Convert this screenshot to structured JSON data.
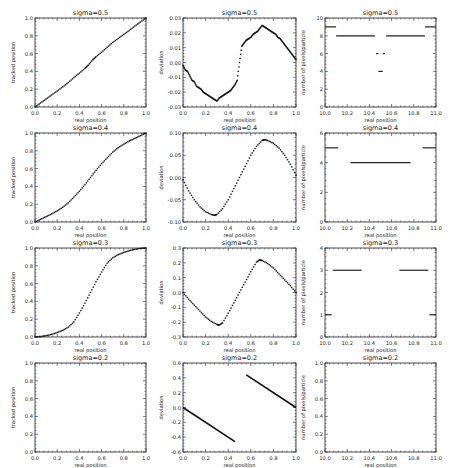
{
  "figure": {
    "rows": 4,
    "cols": 3,
    "layout": {
      "col_x": [
        [
          35,
          146
        ],
        [
          183,
          296
        ],
        [
          325,
          436
        ]
      ],
      "row_y": [
        [
          18,
          107
        ],
        [
          133,
          222
        ],
        [
          248,
          337
        ],
        [
          363,
          452
        ]
      ]
    }
  },
  "chart_data": [
    {
      "id": "r1c1",
      "type": "line",
      "title": "sigma=0.5",
      "xlabel": "real position",
      "ylabel": "tracked position",
      "xlim": [
        0.0,
        1.0
      ],
      "ylim": [
        0.0,
        1.0
      ],
      "xticks": [
        "0.0",
        "0.2",
        "0.4",
        "0.6",
        "0.8",
        "1.0"
      ],
      "yticks": [
        "0.0",
        "0.2",
        "0.4",
        "0.6",
        "0.8",
        "1.0"
      ],
      "series": [
        {
          "name": "tracked",
          "style": "dots",
          "x": [
            0.0,
            0.05,
            0.1,
            0.15,
            0.2,
            0.25,
            0.3,
            0.35,
            0.4,
            0.45,
            0.48,
            0.52,
            0.55,
            0.6,
            0.65,
            0.7,
            0.75,
            0.8,
            0.85,
            0.9,
            0.95,
            1.0
          ],
          "y": [
            0.0,
            0.045,
            0.09,
            0.135,
            0.18,
            0.226,
            0.275,
            0.33,
            0.38,
            0.435,
            0.47,
            0.53,
            0.565,
            0.615,
            0.67,
            0.725,
            0.77,
            0.815,
            0.86,
            0.91,
            0.955,
            1.0
          ]
        }
      ]
    },
    {
      "id": "r1c2",
      "type": "scatter",
      "title": "sigma=0.5",
      "xlabel": "real position",
      "ylabel": "deviation",
      "xlim": [
        0.0,
        1.0
      ],
      "ylim": [
        -0.03,
        0.03
      ],
      "xticks": [
        "0.0",
        "0.2",
        "0.4",
        "0.6",
        "0.8",
        "1.0"
      ],
      "yticks": [
        "-0.03",
        "-0.02",
        "-0.01",
        "0.00",
        "0.01",
        "0.02",
        "0.03"
      ],
      "series": [
        {
          "name": "deviation",
          "style": "dots",
          "x": [
            0.0,
            0.02,
            0.04,
            0.06,
            0.08,
            0.1,
            0.12,
            0.14,
            0.16,
            0.18,
            0.2,
            0.22,
            0.24,
            0.26,
            0.28,
            0.3,
            0.32,
            0.34,
            0.36,
            0.38,
            0.4,
            0.42,
            0.44,
            0.46,
            0.48,
            0.5,
            0.52,
            0.54,
            0.56,
            0.58,
            0.6,
            0.62,
            0.64,
            0.66,
            0.68,
            0.7,
            0.72,
            0.74,
            0.76,
            0.78,
            0.8,
            0.82,
            0.84,
            0.86,
            0.88,
            0.9,
            0.92,
            0.94,
            0.96,
            0.98,
            1.0
          ],
          "y": [
            -0.002,
            -0.005,
            -0.006,
            -0.009,
            -0.012,
            -0.013,
            -0.016,
            -0.017,
            -0.018,
            -0.02,
            -0.021,
            -0.022,
            -0.023,
            -0.024,
            -0.025,
            -0.026,
            -0.024,
            -0.023,
            -0.022,
            -0.021,
            -0.02,
            -0.019,
            -0.017,
            -0.015,
            -0.012,
            0.0,
            0.011,
            0.013,
            0.015,
            0.016,
            0.017,
            0.019,
            0.02,
            0.021,
            0.023,
            0.025,
            0.024,
            0.023,
            0.022,
            0.021,
            0.02,
            0.019,
            0.017,
            0.016,
            0.014,
            0.012,
            0.01,
            0.008,
            0.006,
            0.004,
            0.002
          ]
        }
      ]
    },
    {
      "id": "r1c3",
      "type": "scatter",
      "title": "sigma=0.5",
      "xlabel": "real position",
      "ylabel": "number of pixels/particle",
      "xlim": [
        10.0,
        11.0
      ],
      "ylim": [
        0,
        10
      ],
      "xticks": [
        "10.0",
        "10.2",
        "10.4",
        "10.6",
        "10.8",
        "11.0"
      ],
      "yticks": [
        "0",
        "2",
        "4",
        "6",
        "8",
        "10"
      ],
      "segments": [
        {
          "x0": 10.0,
          "x1": 10.1,
          "y": 9
        },
        {
          "x0": 10.1,
          "x1": 10.45,
          "y": 8
        },
        {
          "x0": 10.55,
          "x1": 10.9,
          "y": 8
        },
        {
          "x0": 10.9,
          "x1": 11.0,
          "y": 9
        },
        {
          "x0": 10.46,
          "x1": 10.48,
          "y": 6
        },
        {
          "x0": 10.52,
          "x1": 10.54,
          "y": 6
        },
        {
          "x0": 10.48,
          "x1": 10.52,
          "y": 4
        }
      ]
    },
    {
      "id": "r2c1",
      "type": "line",
      "title": "sigma=0.4",
      "xlabel": "real position",
      "ylabel": "tracked position",
      "xlim": [
        0.0,
        1.0
      ],
      "ylim": [
        0.0,
        1.0
      ],
      "xticks": [
        "0.0",
        "0.2",
        "0.4",
        "0.6",
        "0.8",
        "1.0"
      ],
      "yticks": [
        "0.0",
        "0.2",
        "0.4",
        "0.6",
        "0.8",
        "1.0"
      ],
      "series": [
        {
          "name": "tracked",
          "style": "dots",
          "x": [
            0.0,
            0.05,
            0.1,
            0.15,
            0.2,
            0.25,
            0.3,
            0.35,
            0.4,
            0.45,
            0.5,
            0.55,
            0.6,
            0.65,
            0.7,
            0.75,
            0.8,
            0.85,
            0.9,
            0.95,
            1.0
          ],
          "y": [
            0.0,
            0.03,
            0.06,
            0.09,
            0.125,
            0.165,
            0.215,
            0.28,
            0.345,
            0.42,
            0.5,
            0.58,
            0.655,
            0.72,
            0.785,
            0.835,
            0.875,
            0.91,
            0.94,
            0.97,
            1.0
          ]
        }
      ]
    },
    {
      "id": "r2c2",
      "type": "scatter",
      "title": "sigma=0.4",
      "xlabel": "real position",
      "ylabel": "deviation",
      "xlim": [
        0.0,
        1.0
      ],
      "ylim": [
        -0.1,
        0.1
      ],
      "xticks": [
        "0.0",
        "0.2",
        "0.4",
        "0.6",
        "0.8",
        "1.0"
      ],
      "yticks": [
        "-0.10",
        "-0.05",
        "0.00",
        "0.05",
        "0.10"
      ],
      "series": [
        {
          "name": "deviation",
          "style": "dots",
          "x": [
            0.0,
            0.05,
            0.1,
            0.15,
            0.2,
            0.25,
            0.28,
            0.3,
            0.35,
            0.4,
            0.45,
            0.5,
            0.55,
            0.6,
            0.65,
            0.7,
            0.72,
            0.75,
            0.8,
            0.85,
            0.9,
            0.95,
            1.0
          ],
          "y": [
            -0.005,
            -0.03,
            -0.05,
            -0.066,
            -0.077,
            -0.083,
            -0.085,
            -0.083,
            -0.07,
            -0.05,
            -0.025,
            0.0,
            0.025,
            0.05,
            0.07,
            0.083,
            0.085,
            0.083,
            0.077,
            0.066,
            0.05,
            0.03,
            0.005
          ]
        }
      ]
    },
    {
      "id": "r2c3",
      "type": "scatter",
      "title": "sigma=0.4",
      "xlabel": "real position",
      "ylabel": "number of pixels/particle",
      "xlim": [
        10.0,
        11.0
      ],
      "ylim": [
        0,
        6
      ],
      "xticks": [
        "10.0",
        "10.2",
        "10.4",
        "10.6",
        "10.8",
        "11.0"
      ],
      "yticks": [
        "0",
        "2",
        "4",
        "6"
      ],
      "segments": [
        {
          "x0": 10.0,
          "x1": 10.12,
          "y": 5
        },
        {
          "x0": 10.23,
          "x1": 10.77,
          "y": 4
        },
        {
          "x0": 10.88,
          "x1": 11.0,
          "y": 5
        }
      ]
    },
    {
      "id": "r3c1",
      "type": "line",
      "title": "sigma=0.3",
      "xlabel": "real position",
      "ylabel": "tracked position",
      "xlim": [
        0.0,
        1.0
      ],
      "ylim": [
        0.0,
        1.0
      ],
      "xticks": [
        "0.0",
        "0.2",
        "0.4",
        "0.6",
        "0.8",
        "1.0"
      ],
      "yticks": [
        "0.0",
        "0.2",
        "0.4",
        "0.6",
        "0.8",
        "1.0"
      ],
      "series": [
        {
          "name": "tracked",
          "style": "dots",
          "x": [
            0.0,
            0.05,
            0.1,
            0.15,
            0.2,
            0.25,
            0.3,
            0.35,
            0.4,
            0.45,
            0.5,
            0.55,
            0.6,
            0.65,
            0.7,
            0.75,
            0.8,
            0.85,
            0.9,
            0.95,
            1.0
          ],
          "y": [
            0.0,
            0.005,
            0.015,
            0.03,
            0.05,
            0.075,
            0.11,
            0.17,
            0.27,
            0.38,
            0.5,
            0.62,
            0.73,
            0.83,
            0.89,
            0.925,
            0.95,
            0.97,
            0.985,
            0.995,
            1.0
          ]
        }
      ]
    },
    {
      "id": "r3c2",
      "type": "scatter",
      "title": "sigma=0.3",
      "xlabel": "real position",
      "ylabel": "deviation",
      "xlim": [
        0.0,
        1.0
      ],
      "ylim": [
        -0.3,
        0.3
      ],
      "xticks": [
        "0.0",
        "0.2",
        "0.4",
        "0.6",
        "0.8",
        "1.0"
      ],
      "yticks": [
        "-0.3",
        "-0.2",
        "-0.1",
        "0.0",
        "0.1",
        "0.2",
        "0.3"
      ],
      "series": [
        {
          "name": "deviation",
          "style": "dots",
          "x": [
            0.0,
            0.05,
            0.1,
            0.15,
            0.2,
            0.25,
            0.3,
            0.32,
            0.35,
            0.4,
            0.45,
            0.5,
            0.55,
            0.6,
            0.65,
            0.68,
            0.7,
            0.75,
            0.8,
            0.85,
            0.9,
            0.95,
            1.0
          ],
          "y": [
            0.0,
            -0.045,
            -0.085,
            -0.125,
            -0.165,
            -0.195,
            -0.215,
            -0.22,
            -0.205,
            -0.14,
            -0.07,
            0.0,
            0.07,
            0.14,
            0.205,
            0.22,
            0.215,
            0.195,
            0.165,
            0.125,
            0.085,
            0.045,
            0.0
          ]
        }
      ]
    },
    {
      "id": "r3c3",
      "type": "scatter",
      "title": "sigma=0.3",
      "xlabel": "real position",
      "ylabel": "number of pixels/particle",
      "xlim": [
        10.0,
        11.0
      ],
      "ylim": [
        0,
        4
      ],
      "xticks": [
        "10.0",
        "10.2",
        "10.4",
        "10.6",
        "10.8",
        "11.0"
      ],
      "yticks": [
        "0",
        "1",
        "2",
        "3",
        "4"
      ],
      "segments": [
        {
          "x0": 10.0,
          "x1": 10.06,
          "y": 1
        },
        {
          "x0": 10.07,
          "x1": 10.33,
          "y": 3
        },
        {
          "x0": 10.67,
          "x1": 10.93,
          "y": 3
        },
        {
          "x0": 10.94,
          "x1": 11.0,
          "y": 1
        }
      ]
    },
    {
      "id": "r4c1",
      "type": "line",
      "title": "sigma=0.2",
      "xlabel": "real position",
      "ylabel": "tracked position",
      "xlim": [
        0.0,
        1.0
      ],
      "ylim": [
        0.0,
        1.0
      ],
      "xticks": [
        "0.0",
        "0.2",
        "0.4",
        "0.6",
        "0.8",
        "1.0"
      ],
      "yticks": [
        "0.0",
        "0.2",
        "0.4",
        "0.6",
        "0.8",
        "1.0"
      ],
      "series": []
    },
    {
      "id": "r4c2",
      "type": "line",
      "title": "sigma=0.2",
      "xlabel": "real position",
      "ylabel": "deviation",
      "xlim": [
        0.0,
        1.0
      ],
      "ylim": [
        -0.6,
        0.6
      ],
      "xticks": [
        "0.0",
        "0.2",
        "0.4",
        "0.6",
        "0.8",
        "1.0"
      ],
      "yticks": [
        "-0.6",
        "-0.4",
        "-0.2",
        "0.0",
        "0.2",
        "0.4",
        "0.6"
      ],
      "series": [
        {
          "name": "deviation-left",
          "style": "line",
          "x": [
            0.0,
            0.46
          ],
          "y": [
            0.0,
            -0.46
          ]
        },
        {
          "name": "deviation-right",
          "style": "line",
          "x": [
            0.56,
            1.0
          ],
          "y": [
            0.44,
            0.0
          ]
        }
      ]
    },
    {
      "id": "r4c3",
      "type": "scatter",
      "title": "sigma=0.2",
      "xlabel": "real position",
      "ylabel": "number of pixels/particle",
      "xlim": [
        10.0,
        11.0
      ],
      "ylim": [
        0.0,
        1.0
      ],
      "xticks": [
        "10.0",
        "10.2",
        "10.4",
        "10.6",
        "10.8",
        "11.0"
      ],
      "yticks": [
        "0.0",
        "0.2",
        "0.4",
        "0.6",
        "0.8",
        "1.0"
      ],
      "segments": []
    }
  ]
}
